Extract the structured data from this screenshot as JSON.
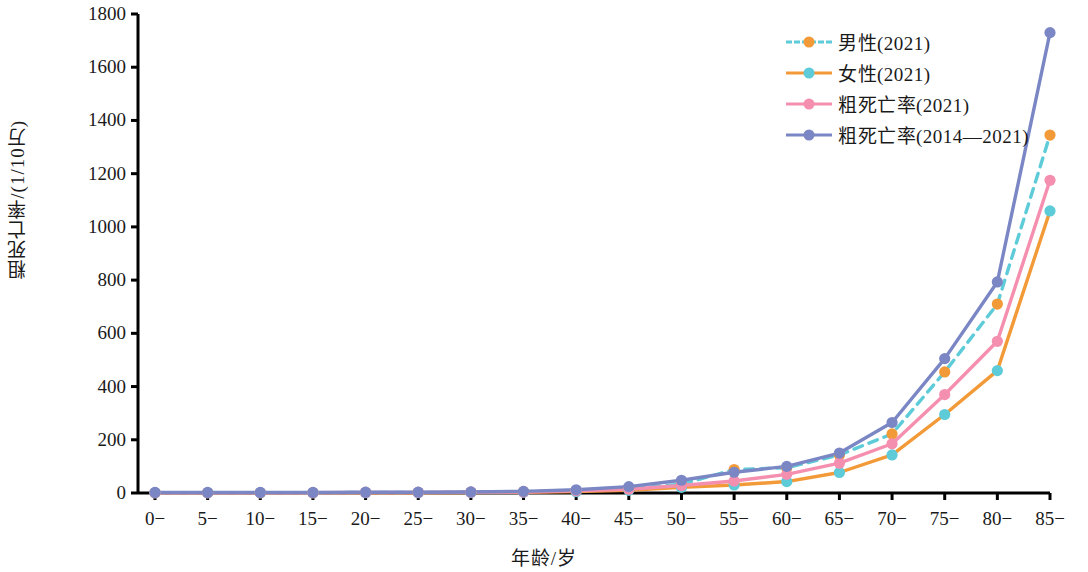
{
  "chart_data": {
    "type": "line",
    "title": "",
    "xlabel": "年龄/岁",
    "ylabel": "粗死亡率/((1/10万)",
    "ylabel_text": "粗死亡率/(1/10万)",
    "categories": [
      "0−",
      "5−",
      "10−",
      "15−",
      "20−",
      "25−",
      "30−",
      "35−",
      "40−",
      "45−",
      "50−",
      "55−",
      "60−",
      "65−",
      "70−",
      "75−",
      "80−",
      "85−"
    ],
    "ylim": [
      0,
      1800
    ],
    "yticks": [
      0,
      200,
      400,
      600,
      800,
      1000,
      1200,
      1400,
      1600,
      1800
    ],
    "ytick_labels": [
      "0",
      "200",
      "400",
      "600",
      "800",
      "1000",
      "1200",
      "1400",
      "1600",
      "1800"
    ],
    "grid": false,
    "legend_position": "top-right",
    "series": [
      {
        "name": "男性(2021)",
        "line_color": "#5ecbd9",
        "marker_color": "#f29a38",
        "line_style": "dashed",
        "values": [
          1,
          1,
          1,
          1,
          2,
          2,
          3,
          5,
          9,
          16,
          33,
          88,
          95,
          143,
          222,
          455,
          710,
          1345
        ]
      },
      {
        "name": "女性(2021)",
        "line_color": "#f29a38",
        "marker_color": "#5ecbd9",
        "line_style": "solid",
        "values": [
          1,
          1,
          1,
          1,
          1,
          1,
          2,
          3,
          5,
          10,
          21,
          30,
          43,
          77,
          143,
          295,
          460,
          1060
        ]
      },
      {
        "name": "粗死亡率(2021)",
        "line_color": "#f58fb0",
        "marker_color": "#f58fb0",
        "line_style": "solid",
        "values": [
          1,
          1,
          1,
          1,
          2,
          2,
          3,
          4,
          8,
          14,
          28,
          45,
          70,
          112,
          185,
          370,
          570,
          1175
        ]
      },
      {
        "name": "粗死亡率(2014—2021)",
        "line_color": "#7b86c4",
        "marker_color": "#7b86c4",
        "line_style": "solid",
        "values": [
          2,
          2,
          2,
          2,
          3,
          3,
          4,
          6,
          12,
          24,
          48,
          78,
          100,
          150,
          265,
          505,
          793,
          1730
        ]
      }
    ]
  },
  "axis": {
    "y_title": "粗死亡率/(1/10万)",
    "x_title": "年龄/岁"
  },
  "colors": {
    "cyan": "#5ecbd9",
    "orange": "#f29a38",
    "pink": "#f58fb0",
    "purple": "#7b86c4",
    "axis": "#000000",
    "text": "#1a1a1a"
  }
}
